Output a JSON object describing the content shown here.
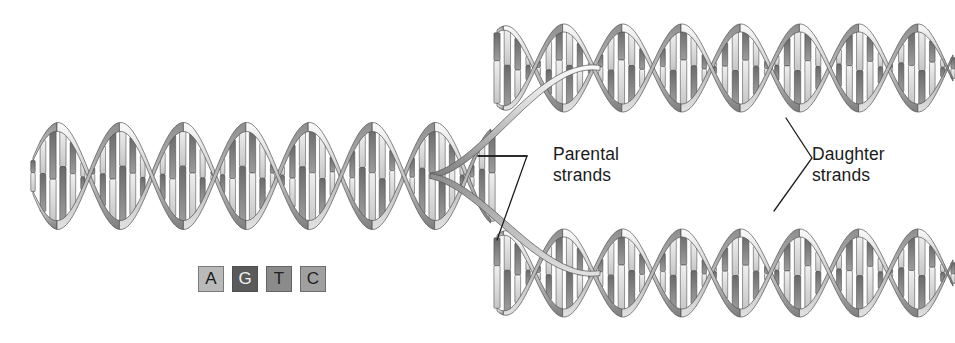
{
  "figure": {
    "background_color": "#ffffff",
    "width": 955,
    "height": 343
  },
  "labels": {
    "parental": {
      "line1": "Parental",
      "line2": "strands"
    },
    "daughter": {
      "line1": "Daughter",
      "line2": "strands"
    }
  },
  "legend": {
    "name": "nucleotide-base-legend",
    "bases": [
      {
        "letter": "A",
        "box_color": "#b9b9b9",
        "text_color": "#1a1a1a"
      },
      {
        "letter": "G",
        "box_color": "#5a5a5a",
        "text_color": "#f2f2f2"
      },
      {
        "letter": "T",
        "box_color": "#8b8b8b",
        "text_color": "#1f1f1f"
      },
      {
        "letter": "C",
        "box_color": "#a0a0a0",
        "text_color": "#1f1f1f"
      }
    ]
  },
  "diagram": {
    "helices": [
      {
        "name": "parental-helix",
        "x_start": 33,
        "x_end": 492,
        "center_y": 176,
        "amplitude": 49,
        "period": 126,
        "phase": 0.35,
        "ribbon_width": 9,
        "rungs": 46
      },
      {
        "name": "daughter-helix-top",
        "x_start": 497,
        "x_end": 953,
        "center_y": 68,
        "amplitude": 40,
        "period": 118,
        "phase": 1.15,
        "ribbon_width": 8,
        "rungs": 44
      },
      {
        "name": "daughter-helix-bottom",
        "x_start": 497,
        "x_end": 953,
        "center_y": 273,
        "amplitude": 40,
        "period": 118,
        "phase": 1.15,
        "ribbon_width": 8,
        "rungs": 44
      }
    ],
    "fork": {
      "name": "replication-fork",
      "split_x": 430,
      "upper_target_y": 68,
      "lower_target_y": 273,
      "end_x": 600
    },
    "leaders": [
      {
        "name": "parental-leader",
        "points": [
          [
            478,
            156
          ],
          [
            527,
            156
          ],
          [
            497,
            240
          ]
        ],
        "stroke": "#1e1e1e",
        "width": 1.3
      },
      {
        "name": "parental-leader-upper",
        "points": [
          [
            527,
            156
          ],
          [
            478,
            156
          ]
        ],
        "stroke": "#1e1e1e",
        "width": 1.3
      },
      {
        "name": "daughter-leader",
        "points": [
          [
            786,
            118
          ],
          [
            812,
            158
          ],
          [
            774,
            211
          ]
        ],
        "stroke": "#1e1e1e",
        "width": 1.3
      }
    ],
    "palette": {
      "ribbon_light": "#f0f0f0",
      "ribbon_mid": "#b4b4b4",
      "ribbon_dark": "#6e6e6e",
      "ribbon_edge": "#4f4f4f",
      "rung_light": "#e8e8e8",
      "rung_mid": "#9a9a9a",
      "rung_dark": "#5c5c5c",
      "rung_outline": "#474747"
    }
  }
}
